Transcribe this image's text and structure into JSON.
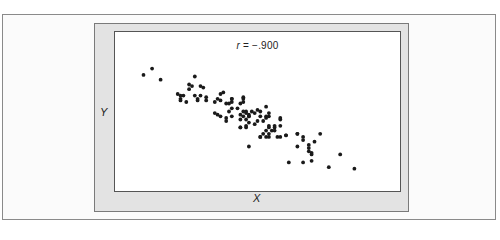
{
  "chart_data": {
    "type": "scatter",
    "title": "",
    "annotation": "r = −.900",
    "correlation": -0.9,
    "xlabel": "X",
    "ylabel": "Y",
    "grid": false,
    "legend": null,
    "ticks": false,
    "xlim": [
      0,
      100
    ],
    "ylim": [
      0,
      100
    ],
    "point_color": "#1a1a1a",
    "points": [
      [
        10,
        73
      ],
      [
        13,
        77
      ],
      [
        16,
        70
      ],
      [
        26,
        67
      ],
      [
        27,
        66
      ],
      [
        28,
        72
      ],
      [
        30,
        66
      ],
      [
        31,
        65
      ],
      [
        23,
        58
      ],
      [
        25,
        56
      ],
      [
        23,
        57
      ],
      [
        22,
        61
      ],
      [
        24,
        60
      ],
      [
        26,
        64
      ],
      [
        28,
        60
      ],
      [
        29,
        58
      ],
      [
        29,
        57
      ],
      [
        30,
        60
      ],
      [
        32,
        59
      ],
      [
        32,
        57
      ],
      [
        23,
        60
      ],
      [
        35,
        56
      ],
      [
        36,
        58
      ],
      [
        37,
        61
      ],
      [
        37,
        57
      ],
      [
        38,
        62
      ],
      [
        39,
        55
      ],
      [
        40,
        55
      ],
      [
        41,
        58
      ],
      [
        41,
        56
      ],
      [
        35,
        49
      ],
      [
        36,
        48
      ],
      [
        37,
        47
      ],
      [
        39,
        44
      ],
      [
        39,
        46
      ],
      [
        40,
        50
      ],
      [
        41,
        52
      ],
      [
        41,
        47
      ],
      [
        41,
        58
      ],
      [
        43,
        52
      ],
      [
        44,
        55
      ],
      [
        45,
        58
      ],
      [
        45,
        59
      ],
      [
        45,
        56
      ],
      [
        44,
        48
      ],
      [
        46,
        49
      ],
      [
        45,
        47
      ],
      [
        44,
        40
      ],
      [
        44,
        45
      ],
      [
        46,
        40
      ],
      [
        45,
        50
      ],
      [
        46,
        50
      ],
      [
        46,
        45
      ],
      [
        47,
        43
      ],
      [
        47,
        48
      ],
      [
        48,
        50
      ],
      [
        46,
        41
      ],
      [
        47,
        47
      ],
      [
        49,
        42
      ],
      [
        49,
        49
      ],
      [
        51,
        50
      ],
      [
        53,
        53
      ],
      [
        50,
        51
      ],
      [
        51,
        47
      ],
      [
        52,
        44
      ],
      [
        53,
        46
      ],
      [
        50,
        44
      ],
      [
        53,
        47
      ],
      [
        54,
        49
      ],
      [
        47,
        28
      ],
      [
        44,
        40
      ],
      [
        47,
        47
      ],
      [
        51,
        34
      ],
      [
        52,
        36
      ],
      [
        54,
        40
      ],
      [
        54,
        47
      ],
      [
        54,
        41
      ],
      [
        55,
        38
      ],
      [
        56,
        41
      ],
      [
        56,
        40
      ],
      [
        57,
        34
      ],
      [
        58,
        34
      ],
      [
        58,
        46
      ],
      [
        58,
        45
      ],
      [
        58,
        41
      ],
      [
        56,
        38
      ],
      [
        51,
        34
      ],
      [
        54,
        34
      ],
      [
        53,
        34
      ],
      [
        53,
        38
      ],
      [
        54,
        36
      ],
      [
        60,
        35
      ],
      [
        60,
        35
      ],
      [
        64,
        36
      ],
      [
        64,
        36
      ],
      [
        64,
        28
      ],
      [
        66,
        32
      ],
      [
        68,
        29
      ],
      [
        68,
        27
      ],
      [
        69,
        24
      ],
      [
        69,
        23
      ],
      [
        68,
        25
      ],
      [
        70,
        31
      ],
      [
        72,
        36
      ],
      [
        61,
        18
      ],
      [
        66,
        18
      ],
      [
        69,
        19
      ],
      [
        75,
        15
      ],
      [
        79,
        23
      ],
      [
        84,
        14
      ],
      [
        66,
        34
      ]
    ]
  },
  "labels": {
    "r_symbol": "r",
    "r_value": " = −.900",
    "x_axis": "X",
    "y_axis": "Y"
  }
}
